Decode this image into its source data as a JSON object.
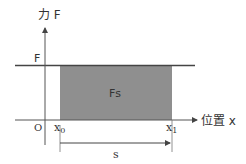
{
  "diagram": {
    "y_axis_label": "力 F",
    "x_axis_label": "位置 x",
    "origin_label": "O",
    "force_level_label": "F",
    "area_label": "Fs",
    "x0_label": "x",
    "x0_sub": "0",
    "x1_label": "x",
    "x1_sub": "1",
    "displacement_label": "s",
    "colors": {
      "area_fill": "#8f8f8f",
      "line": "#444444",
      "axis": "#555555"
    }
  }
}
